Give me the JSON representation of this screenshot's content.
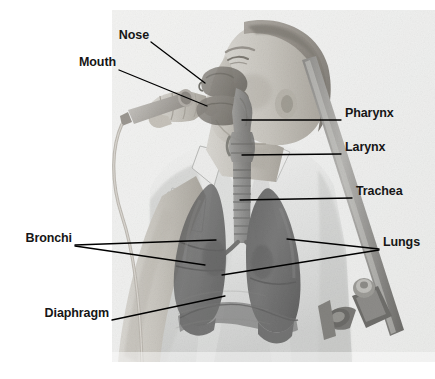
{
  "figure": {
    "background_color": "#ffffff",
    "photo": {
      "subject": "singer holding a microphone, head tilted back in profile",
      "tone": "grayscale halftone photograph",
      "bounds": {
        "x": 112,
        "y": 10,
        "width": 323,
        "height": 352
      },
      "elements": [
        {
          "name": "head-profile",
          "description": "head turned to the left, mouth open"
        },
        {
          "name": "hand-with-microphone",
          "description": "hand gripping a handheld microphone"
        },
        {
          "name": "microphone-cable",
          "description": "cable curving down from the microphone"
        },
        {
          "name": "shirt-collar",
          "description": "light open-collar shirt"
        },
        {
          "name": "microphone-stand",
          "description": "diagonal stand with clamp and knob at right"
        }
      ]
    },
    "overlay": {
      "description": "semi-transparent anatomical illustration of the respiratory tract",
      "organ_color": "#5f5f5f",
      "airway_color": "#8d8d8d",
      "parts": [
        "nasal cavity",
        "oral cavity",
        "pharynx",
        "larynx",
        "trachea",
        "left lung",
        "right lung",
        "bronchi",
        "diaphragm"
      ]
    },
    "leader_line": {
      "color": "#000000",
      "width_px": 1.3
    }
  },
  "labels": [
    {
      "id": "nose",
      "text": "Nose",
      "side": "left",
      "text_x": 147,
      "text_y": 35,
      "leader": [
        [
          151,
          42
        ],
        [
          205,
          83
        ]
      ]
    },
    {
      "id": "mouth",
      "text": "Mouth",
      "side": "left",
      "text_x": 115,
      "text_y": 62,
      "leader": [
        [
          119,
          70
        ],
        [
          207,
          106
        ]
      ]
    },
    {
      "id": "pharynx",
      "text": "Pharynx",
      "side": "right",
      "text_x": 345,
      "text_y": 113,
      "leader": [
        [
          341,
          120
        ],
        [
          242,
          120
        ]
      ]
    },
    {
      "id": "larynx",
      "text": "Larynx",
      "side": "right",
      "text_x": 345,
      "text_y": 147,
      "leader": [
        [
          341,
          154
        ],
        [
          242,
          155
        ]
      ]
    },
    {
      "id": "trachea",
      "text": "Trachea",
      "side": "right",
      "text_x": 356,
      "text_y": 191,
      "leader": [
        [
          352,
          198
        ],
        [
          240,
          200
        ]
      ]
    },
    {
      "id": "bronchi",
      "text": "Bronchi",
      "side": "left",
      "text_x": 27,
      "text_y": 238,
      "leader_multi": [
        [
          [
            75,
            245
          ],
          [
            216,
            240
          ]
        ],
        [
          [
            75,
            246
          ],
          [
            205,
            265
          ]
        ]
      ]
    },
    {
      "id": "lungs",
      "text": "Lungs",
      "side": "right",
      "text_x": 383,
      "text_y": 242,
      "leader_multi": [
        [
          [
            379,
            249
          ],
          [
            287,
            239
          ]
        ],
        [
          [
            379,
            250
          ],
          [
            222,
            275
          ]
        ]
      ]
    },
    {
      "id": "diaphragm",
      "text": "Diaphragm",
      "side": "left",
      "text_x": 44,
      "text_y": 313,
      "leader": [
        [
          112,
          320
        ],
        [
          225,
          296
        ]
      ]
    }
  ]
}
